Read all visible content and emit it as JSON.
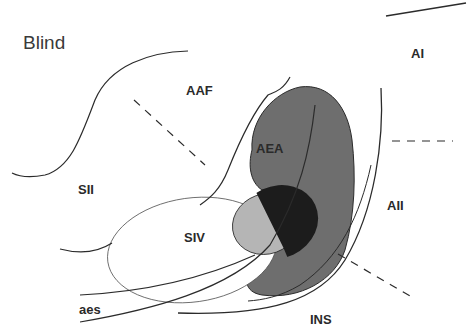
{
  "title": "Blind",
  "colors": {
    "background": "#ffffff",
    "line": "#2b2b2b",
    "aea_fill": "#6e6e6e",
    "overlap_dark": "#1c1c1c",
    "overlap_light": "#b5b5b5",
    "siv_fill": "#ffffff"
  },
  "regions": [
    {
      "id": "AAF",
      "label": "AAF"
    },
    {
      "id": "AI",
      "label": "AI"
    },
    {
      "id": "AEA",
      "label": "AEA"
    },
    {
      "id": "SII",
      "label": "SII"
    },
    {
      "id": "SIV",
      "label": "SIV"
    },
    {
      "id": "AII",
      "label": "AII"
    },
    {
      "id": "aes",
      "label": "aes"
    },
    {
      "id": "INS",
      "label": "INS"
    }
  ]
}
